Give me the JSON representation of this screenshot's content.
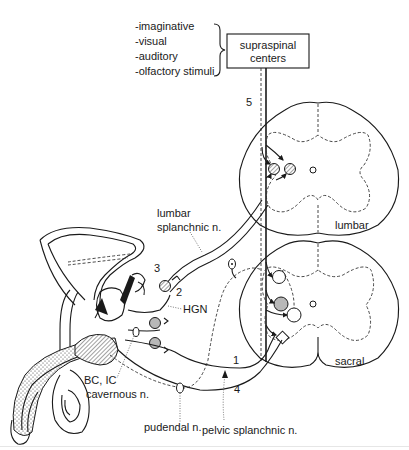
{
  "diagram": {
    "stimuli": {
      "items": [
        "-imaginative",
        "-visual",
        "-auditory",
        "-olfactory stimuli"
      ]
    },
    "supraspinal_box": {
      "line1": "supraspinal",
      "line2": "centers"
    },
    "spinal_segments": {
      "lumbar": "lumbar",
      "sacral": "sacral"
    },
    "pathway_numbers": {
      "n1": "1",
      "n2": "2",
      "n3": "3",
      "n4": "4",
      "n5": "5"
    },
    "nerve_labels": {
      "lumbar_splanchnic_1": "lumbar",
      "lumbar_splanchnic_2": "splanchnic n.",
      "hgn": "HGN",
      "bc_ic": "BC, IC",
      "cavernous": "cavernous n.",
      "pudendal": "pudendal n.",
      "pelvic_splanchnic": "pelvic splanchnic n."
    },
    "colors": {
      "line": "#1a1a1a",
      "ganglion_grey": "#b8b8b8",
      "background": "#ffffff"
    }
  }
}
